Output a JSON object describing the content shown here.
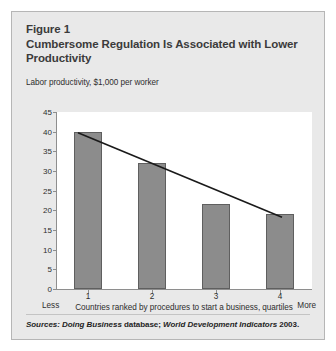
{
  "figure": {
    "title_lines": [
      "Figure 1",
      "Cumbersome Regulation Is Associated with Lower",
      "Productivity"
    ],
    "source_note": {
      "label": "Sources:",
      "part1_italic": "Doing Business",
      "part2_roman": "database;",
      "part3_italic": "World Development Indicators",
      "part4_roman": "2003."
    }
  },
  "chart_data": {
    "type": "bar",
    "title": "Cumbersome Regulation Is Associated with Lower Productivity",
    "subtitle": "Figure 1",
    "categories": [
      "1",
      "2",
      "3",
      "4"
    ],
    "values": [
      40,
      32,
      21.5,
      19
    ],
    "xlabel": "Countries ranked by procedures to start a business, quartiles",
    "ylabel": "Labor productivity, $1,000 per worker",
    "ylim": [
      0,
      45
    ],
    "y_ticks": [
      "45",
      "40",
      "35",
      "30",
      "25",
      "20",
      "15",
      "10",
      "5",
      "0"
    ],
    "y_tick_values": [
      45,
      40,
      35,
      30,
      25,
      20,
      15,
      10,
      5,
      0
    ],
    "axis_endpoint_left": "Less",
    "axis_endpoint_right": "More",
    "grid": false,
    "legend": "none",
    "overlay": {
      "type": "line",
      "name": "trend-line",
      "x": [
        1,
        4
      ],
      "y": [
        40,
        19
      ],
      "color": "#1a1a1a"
    },
    "colors": {
      "bar_fill": "#8c8c8c",
      "bar_border": "#5f5f5f",
      "axis": "#8e8e8e",
      "panel_bg": "#e9e9e9",
      "plot_bg": "#ffffff",
      "text": "#2e2e2e",
      "title_text": "#3b3b3b"
    }
  }
}
